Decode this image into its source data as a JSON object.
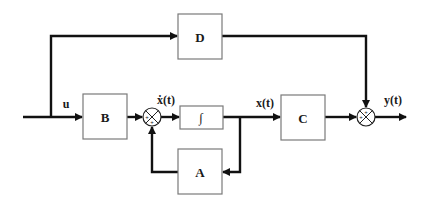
{
  "diagram": {
    "blocks": {
      "B": "B",
      "D": "D",
      "integrator": "∫",
      "A": "A",
      "C": "C"
    },
    "signals": {
      "input": "u",
      "state_derivative": "ẋ(t)",
      "state": "x(t)",
      "output": "y(t)"
    },
    "sum_junctions": {
      "sum1_signs": [
        "+",
        "+"
      ],
      "sum2_signs": [
        "+",
        "+"
      ]
    },
    "colors": {
      "wire": "#111111",
      "block_border": "#7a7a7a",
      "background": "#ffffff"
    }
  }
}
